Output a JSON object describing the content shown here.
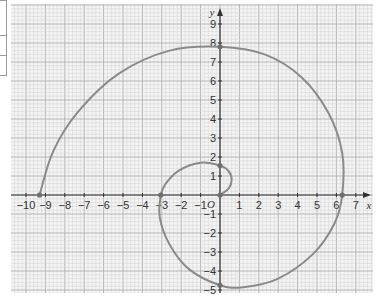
{
  "chart_data": {
    "type": "line",
    "title": "",
    "xlabel": "x",
    "ylabel": "y",
    "origin_label": "O",
    "xlim": [
      -10.5,
      7.9
    ],
    "ylim": [
      -5.1,
      10
    ],
    "grid": true,
    "minor_grid_per_unit": 5,
    "x_ticks": [
      -10,
      -9,
      -8,
      -7,
      -6,
      -5,
      -4,
      -3,
      -2,
      -1,
      1,
      2,
      3,
      4,
      5,
      6,
      7
    ],
    "y_ticks": [
      -5,
      -4,
      -3,
      -2,
      -1,
      1,
      2,
      3,
      4,
      5,
      6,
      7,
      8,
      9
    ],
    "series": [
      {
        "name": "spiral",
        "color": "#8a8a8a",
        "points": [
          [
            0,
            0
          ],
          [
            0.45,
            0.35
          ],
          [
            0.6,
            0.8
          ],
          [
            0.45,
            1.25
          ],
          [
            0,
            1.55
          ],
          [
            -1,
            1.7
          ],
          [
            -2.1,
            1.3
          ],
          [
            -2.8,
            0.6
          ],
          [
            -3.05,
            0
          ],
          [
            -3.1,
            -1.2
          ],
          [
            -2.6,
            -2.6
          ],
          [
            -1.6,
            -3.9
          ],
          [
            0,
            -4.75
          ],
          [
            1.2,
            -4.85
          ],
          [
            3,
            -4.4
          ],
          [
            4.8,
            -3.1
          ],
          [
            5.9,
            -1.5
          ],
          [
            6.3,
            0
          ],
          [
            6.3,
            2.2
          ],
          [
            5.6,
            4.3
          ],
          [
            4.2,
            6.2
          ],
          [
            2.3,
            7.4
          ],
          [
            0,
            7.8
          ],
          [
            -2.6,
            7.6
          ],
          [
            -5.2,
            6.4
          ],
          [
            -7.3,
            4.4
          ],
          [
            -8.6,
            2.3
          ],
          [
            -9.3,
            0
          ]
        ],
        "marked_points": [
          [
            0,
            0
          ],
          [
            0,
            1.55
          ],
          [
            -3.05,
            0
          ],
          [
            0,
            -4.75
          ],
          [
            6.3,
            0
          ],
          [
            0,
            7.8
          ],
          [
            -9.3,
            0
          ]
        ]
      }
    ]
  }
}
